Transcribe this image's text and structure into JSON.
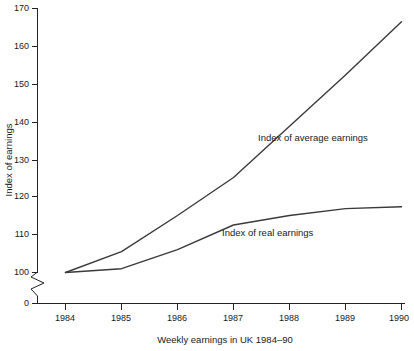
{
  "chart_data": {
    "type": "line",
    "title": "",
    "xlabel": "Weekly earnings in UK 1984–90",
    "ylabel": "Index of earnings",
    "categories": [
      "1984",
      "1985",
      "1986",
      "1987",
      "1988",
      "1989",
      "1990"
    ],
    "x": [
      1984,
      1985,
      1986,
      1987,
      1988,
      1989,
      1990
    ],
    "series": [
      {
        "name": "Index of average earnings",
        "values": [
          100,
          105.5,
          115,
          125,
          138.5,
          152,
          166
        ]
      },
      {
        "name": "Index of real earnings",
        "values": [
          100,
          101,
          106,
          112.5,
          115,
          116.8,
          117.3
        ]
      }
    ],
    "ylim": [
      0,
      170
    ],
    "ytick_labels": [
      "0",
      "100",
      "110",
      "120",
      "130",
      "140",
      "150",
      "160",
      "170"
    ],
    "ytick_values": [
      0,
      100,
      110,
      120,
      130,
      140,
      150,
      160,
      170
    ],
    "xtick_labels": [
      "1984",
      "1985",
      "1986",
      "1987",
      "1988",
      "1989",
      "1990"
    ],
    "axis_break": true,
    "axis_break_note": "zigzag break on y-axis between 0 and 100",
    "grid": false,
    "legend": "inline-labels",
    "annotations": [
      {
        "text": "Index of average earnings",
        "series": "Index of average earnings"
      },
      {
        "text": "Index of real earnings",
        "series": "Index of real earnings"
      }
    ],
    "colors": {
      "line": "#3a3a3a",
      "axis": "#222222",
      "text": "#1a1a1a",
      "background": "#ffffff"
    }
  },
  "axis": {
    "y_label": "Index of earnings",
    "x_label": "Weekly earnings in UK 1984–90",
    "y_ticks": [
      {
        "label": "170"
      },
      {
        "label": "160"
      },
      {
        "label": "150"
      },
      {
        "label": "140"
      },
      {
        "label": "130"
      },
      {
        "label": "120"
      },
      {
        "label": "110"
      },
      {
        "label": "100"
      },
      {
        "label": "0"
      }
    ],
    "x_ticks": [
      {
        "label": "1984"
      },
      {
        "label": "1985"
      },
      {
        "label": "1986"
      },
      {
        "label": "1987"
      },
      {
        "label": "1988"
      },
      {
        "label": "1989"
      },
      {
        "label": "1990"
      }
    ]
  },
  "labels": {
    "average": "Index of average earnings",
    "real": "Index of real earnings"
  }
}
